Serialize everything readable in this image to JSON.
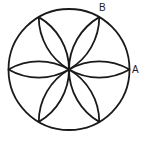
{
  "diagram": {
    "type": "geometric-rosette",
    "circle": {
      "cx": 69,
      "cy": 69.5,
      "r": 60.5
    },
    "petal_count": 6,
    "petal_angles_deg": [
      0,
      60,
      120,
      180,
      240,
      300
    ],
    "stroke_color": "#1a1a1a",
    "stroke_width": 1.8,
    "labels": [
      {
        "id": "A",
        "text": "A",
        "x": 132,
        "y": 73
      },
      {
        "id": "B",
        "text": "B",
        "x": 99,
        "y": 11
      }
    ]
  }
}
